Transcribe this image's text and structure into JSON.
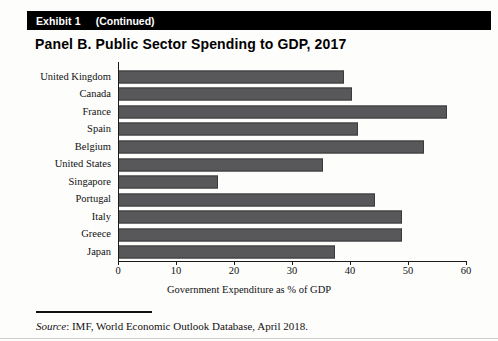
{
  "exhibit": {
    "label": "Exhibit 1",
    "continued": "(Continued)"
  },
  "panel_title": "Panel B. Public Sector Spending to GDP, 2017",
  "footer": {
    "source_word": "Source",
    "source_text": ": IMF, World Economic Outlook Database, April 2018."
  },
  "colors": {
    "bar_fill": "#58585a",
    "bar_stroke": "#3a3a3c",
    "header_bar": "#000000",
    "axis": "#1b1b1b",
    "text": "#111111"
  },
  "chart_data": {
    "type": "bar",
    "orientation": "horizontal",
    "title": "Panel B. Public Sector Spending to GDP, 2017",
    "subtitle": "",
    "xlabel": "Government Expenditure as % of GDP",
    "ylabel": "",
    "xlim": [
      0,
      60
    ],
    "xticks": [
      0,
      10,
      20,
      30,
      40,
      50,
      60
    ],
    "xticklabels": [
      "0",
      "10",
      "20",
      "30",
      "40",
      "50",
      "60"
    ],
    "grid": false,
    "legend": false,
    "categories": [
      "United Kingdom",
      "Canada",
      "France",
      "Spain",
      "Belgium",
      "United States",
      "Singapore",
      "Portugal",
      "Italy",
      "Greece",
      "Japan"
    ],
    "values": [
      39.0,
      40.3,
      56.8,
      41.4,
      52.8,
      35.3,
      17.2,
      44.3,
      48.9,
      48.9,
      37.4
    ]
  }
}
